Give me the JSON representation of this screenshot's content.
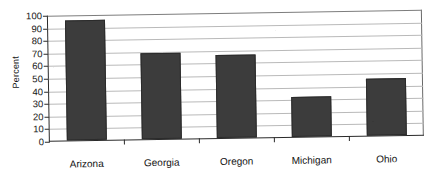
{
  "chart_data": {
    "type": "bar",
    "title": "",
    "subtitle": "",
    "xlabel": "",
    "ylabel": "Percent",
    "categories": [
      "Arizona",
      "Georgia",
      "Oregon",
      "Michigan",
      "Ohio"
    ],
    "values": [
      95,
      68,
      66,
      32,
      45
    ],
    "series": [
      {
        "name": "Percent",
        "values": [
          95,
          68,
          66,
          32,
          45
        ]
      }
    ],
    "ylim": [
      0,
      100
    ],
    "ytick_labels": [
      "100",
      "90",
      "80",
      "70",
      "60",
      "50",
      "40",
      "30",
      "20",
      "10",
      "0"
    ],
    "ytick_values": [
      100,
      90,
      80,
      70,
      60,
      50,
      40,
      30,
      20,
      10,
      0
    ],
    "grid": "horizontal",
    "legend": "none",
    "bar_color": "#3c3c3c",
    "gridline_color": "#b9b9b9",
    "axis_color": "#2a2a2a",
    "background_color": "#ffffff",
    "annotations": []
  }
}
